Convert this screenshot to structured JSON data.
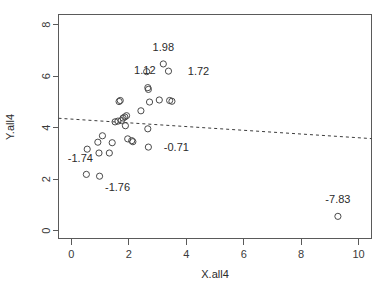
{
  "chart_data": {
    "type": "scatter",
    "title": "",
    "xlabel": "X.all4",
    "ylabel": "Y.all4",
    "xlim": [
      -0.45,
      10.45
    ],
    "ylim": [
      -0.3,
      8.4
    ],
    "xticks": [
      0,
      2,
      4,
      6,
      8,
      10
    ],
    "yticks": [
      0,
      2,
      4,
      6,
      8
    ],
    "xticklabels": [
      "0",
      "2",
      "4",
      "6",
      "8",
      "10"
    ],
    "yticklabels": [
      "0",
      "2",
      "4",
      "6",
      "8"
    ],
    "grid": false,
    "legend": null,
    "points": [
      {
        "x": 0.55,
        "y": 3.17,
        "label": null
      },
      {
        "x": 0.52,
        "y": 2.19,
        "label": "-1.74",
        "label_dx": -6,
        "label_dy": -12,
        "label_anchor": "middle"
      },
      {
        "x": 0.98,
        "y": 2.12,
        "label": "-1.76",
        "label_dx": 18,
        "label_dy": 15,
        "label_anchor": "middle"
      },
      {
        "x": 0.96,
        "y": 3.02,
        "label": null
      },
      {
        "x": 0.92,
        "y": 3.44,
        "label": null
      },
      {
        "x": 1.08,
        "y": 3.69,
        "label": null
      },
      {
        "x": 1.32,
        "y": 3.02,
        "label": null
      },
      {
        "x": 1.42,
        "y": 3.42,
        "label": null
      },
      {
        "x": 1.66,
        "y": 5.02,
        "label": null
      },
      {
        "x": 1.7,
        "y": 5.06,
        "label": null
      },
      {
        "x": 1.52,
        "y": 4.23,
        "label": null
      },
      {
        "x": 1.62,
        "y": 4.26,
        "label": null
      },
      {
        "x": 1.74,
        "y": 4.28,
        "label": null
      },
      {
        "x": 1.8,
        "y": 4.38,
        "label": null
      },
      {
        "x": 1.86,
        "y": 4.42,
        "label": null
      },
      {
        "x": 1.92,
        "y": 4.47,
        "label": null
      },
      {
        "x": 1.88,
        "y": 4.08,
        "label": null
      },
      {
        "x": 1.96,
        "y": 3.57,
        "label": null
      },
      {
        "x": 2.1,
        "y": 3.5,
        "label": null
      },
      {
        "x": 2.14,
        "y": 3.46,
        "label": null
      },
      {
        "x": 2.42,
        "y": 4.66,
        "label": null
      },
      {
        "x": 2.66,
        "y": 3.96,
        "label": null
      },
      {
        "x": 2.68,
        "y": 3.25,
        "label": "-0.71",
        "label_dx": 28,
        "label_dy": 4,
        "label_anchor": "middle"
      },
      {
        "x": 2.62,
        "y": 6.18,
        "label": null
      },
      {
        "x": 2.66,
        "y": 5.56,
        "label": "1.12",
        "label_dx": -3,
        "label_dy": -14,
        "label_anchor": "middle"
      },
      {
        "x": 2.68,
        "y": 5.49,
        "label": null
      },
      {
        "x": 2.72,
        "y": 5.0,
        "label": null
      },
      {
        "x": 3.06,
        "y": 5.08,
        "label": null
      },
      {
        "x": 3.2,
        "y": 6.48,
        "label": "1.98",
        "label_dx": 0,
        "label_dy": -13,
        "label_anchor": "middle"
      },
      {
        "x": 3.38,
        "y": 6.2,
        "label": "1.72",
        "label_dx": 30,
        "label_dy": 4,
        "label_anchor": "middle"
      },
      {
        "x": 3.42,
        "y": 5.06,
        "label": null
      },
      {
        "x": 3.5,
        "y": 5.03,
        "label": null
      },
      {
        "x": 9.28,
        "y": 0.56,
        "label": "-7.83",
        "label_dx": 0,
        "label_dy": -13,
        "label_anchor": "middle"
      }
    ],
    "fit_line": {
      "style": "dashed",
      "x_start": -0.45,
      "y_start": 4.37,
      "x_end": 10.45,
      "y_end": 3.58
    }
  }
}
